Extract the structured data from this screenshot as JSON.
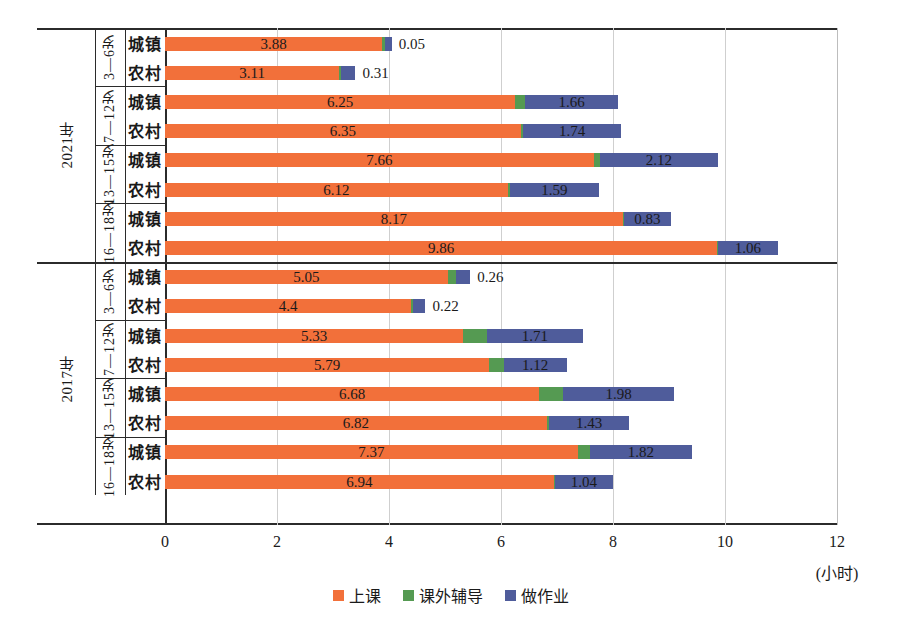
{
  "chart_data": {
    "type": "bar",
    "orientation": "horizontal",
    "stacked": true,
    "title": "",
    "xlabel": "(小时)",
    "ylabel": "",
    "xlim": [
      0,
      12
    ],
    "xticks": [
      "0",
      "2",
      "4",
      "6",
      "8",
      "10",
      "12"
    ],
    "grid": true,
    "legend_position": "bottom",
    "legend": [
      "上课",
      "课外辅导",
      "做作业"
    ],
    "series": [
      {
        "name": "上课",
        "color": "#F2703A"
      },
      {
        "name": "课外辅导",
        "color": "#559A52"
      },
      {
        "name": "做作业",
        "color": "#4F5C9B"
      }
    ],
    "years": [
      {
        "label": "2021年",
        "groups": [
          {
            "age": "3—6岁",
            "rows": [
              {
                "residence": "城镇",
                "values": [
                  3.88,
                  0.05,
                  0.12
                ],
                "labels": [
                  {
                    "text": "3.88",
                    "series": 0,
                    "placement": "inside"
                  },
                  {
                    "text": "0.05",
                    "series": 2,
                    "placement": "outside"
                  }
                ]
              },
              {
                "residence": "农村",
                "values": [
                  3.11,
                  0.04,
                  0.25
                ],
                "labels": [
                  {
                    "text": "3.11",
                    "series": 0,
                    "placement": "inside"
                  },
                  {
                    "text": "0.31",
                    "series": 2,
                    "placement": "outside"
                  }
                ]
              }
            ]
          },
          {
            "age": "7—12岁",
            "rows": [
              {
                "residence": "城镇",
                "values": [
                  6.25,
                  0.18,
                  1.66
                ],
                "labels": [
                  {
                    "text": "6.25",
                    "series": 0,
                    "placement": "inside"
                  },
                  {
                    "text": "1.66",
                    "series": 2,
                    "placement": "inside"
                  }
                ]
              },
              {
                "residence": "农村",
                "values": [
                  6.35,
                  0.05,
                  1.74
                ],
                "labels": [
                  {
                    "text": "6.35",
                    "series": 0,
                    "placement": "inside"
                  },
                  {
                    "text": "1.74",
                    "series": 2,
                    "placement": "inside"
                  }
                ]
              }
            ]
          },
          {
            "age": "13—15岁",
            "rows": [
              {
                "residence": "城镇",
                "values": [
                  7.66,
                  0.1,
                  2.12
                ],
                "labels": [
                  {
                    "text": "7.66",
                    "series": 0,
                    "placement": "inside"
                  },
                  {
                    "text": "2.12",
                    "series": 2,
                    "placement": "inside"
                  }
                ]
              },
              {
                "residence": "农村",
                "values": [
                  6.12,
                  0.04,
                  1.59
                ],
                "labels": [
                  {
                    "text": "6.12",
                    "series": 0,
                    "placement": "inside"
                  },
                  {
                    "text": "1.59",
                    "series": 2,
                    "placement": "inside"
                  }
                ]
              }
            ]
          },
          {
            "age": "16—18岁",
            "rows": [
              {
                "residence": "城镇",
                "values": [
                  8.17,
                  0.03,
                  0.83
                ],
                "labels": [
                  {
                    "text": "8.17",
                    "series": 0,
                    "placement": "inside"
                  },
                  {
                    "text": "0.83",
                    "series": 2,
                    "placement": "inside"
                  }
                ]
              },
              {
                "residence": "农村",
                "values": [
                  9.86,
                  0.02,
                  1.06
                ],
                "labels": [
                  {
                    "text": "9.86",
                    "series": 0,
                    "placement": "inside"
                  },
                  {
                    "text": "1.06",
                    "series": 2,
                    "placement": "inside"
                  }
                ]
              }
            ]
          }
        ]
      },
      {
        "label": "2017年",
        "groups": [
          {
            "age": "3—6岁",
            "rows": [
              {
                "residence": "城镇",
                "values": [
                  5.05,
                  0.14,
                  0.26
                ],
                "labels": [
                  {
                    "text": "5.05",
                    "series": 0,
                    "placement": "inside"
                  },
                  {
                    "text": "0.26",
                    "series": 2,
                    "placement": "outside"
                  }
                ]
              },
              {
                "residence": "农村",
                "values": [
                  4.4,
                  0.03,
                  0.22
                ],
                "labels": [
                  {
                    "text": "4.4",
                    "series": 0,
                    "placement": "inside"
                  },
                  {
                    "text": "0.22",
                    "series": 2,
                    "placement": "outside"
                  }
                ]
              }
            ]
          },
          {
            "age": "7—12岁",
            "rows": [
              {
                "residence": "城镇",
                "values": [
                  5.33,
                  0.42,
                  1.71
                ],
                "labels": [
                  {
                    "text": "5.33",
                    "series": 0,
                    "placement": "inside"
                  },
                  {
                    "text": "1.71",
                    "series": 2,
                    "placement": "inside"
                  }
                ]
              },
              {
                "residence": "农村",
                "values": [
                  5.79,
                  0.26,
                  1.12
                ],
                "labels": [
                  {
                    "text": "5.79",
                    "series": 0,
                    "placement": "inside"
                  },
                  {
                    "text": "1.12",
                    "series": 2,
                    "placement": "inside"
                  }
                ]
              }
            ]
          },
          {
            "age": "13—15岁",
            "rows": [
              {
                "residence": "城镇",
                "values": [
                  6.68,
                  0.43,
                  1.98
                ],
                "labels": [
                  {
                    "text": "6.68",
                    "series": 0,
                    "placement": "inside"
                  },
                  {
                    "text": "1.98",
                    "series": 2,
                    "placement": "inside"
                  }
                ]
              },
              {
                "residence": "农村",
                "values": [
                  6.82,
                  0.04,
                  1.43
                ],
                "labels": [
                  {
                    "text": "6.82",
                    "series": 0,
                    "placement": "inside"
                  },
                  {
                    "text": "1.43",
                    "series": 2,
                    "placement": "inside"
                  }
                ]
              }
            ]
          },
          {
            "age": "16—18岁",
            "rows": [
              {
                "residence": "城镇",
                "values": [
                  7.37,
                  0.22,
                  1.82
                ],
                "labels": [
                  {
                    "text": "7.37",
                    "series": 0,
                    "placement": "inside"
                  },
                  {
                    "text": "1.82",
                    "series": 2,
                    "placement": "inside"
                  }
                ]
              },
              {
                "residence": "农村",
                "values": [
                  6.94,
                  0.02,
                  1.04
                ],
                "labels": [
                  {
                    "text": "6.94",
                    "series": 0,
                    "placement": "inside"
                  },
                  {
                    "text": "1.04",
                    "series": 2,
                    "placement": "inside"
                  }
                ]
              }
            ]
          }
        ]
      }
    ]
  }
}
